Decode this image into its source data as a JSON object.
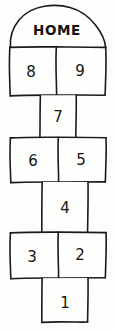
{
  "drawing": {
    "title": "hopscotch-court",
    "style": "hand-drawn ink sketch",
    "medium": "black pen on white paper",
    "canvas": {
      "width": 116,
      "height": 330,
      "background_color": "#fdfdfb"
    },
    "ink_color": "#1a1a18",
    "cell_fill_color": "#fefefc"
  },
  "labels": {
    "home": "HOME"
  },
  "cells": [
    {
      "id": "home-arch",
      "label": "HOME",
      "shape": "dome",
      "x": 10,
      "y": 5,
      "width": 96,
      "height": 42,
      "label_x": 57,
      "label_y": 31
    },
    {
      "id": "cell-8",
      "label": "8",
      "shape": "rect",
      "x": 9,
      "y": 47,
      "width": 47,
      "height": 48,
      "label_x": 31,
      "label_y": 72
    },
    {
      "id": "cell-9",
      "label": "9",
      "shape": "rect",
      "x": 56,
      "y": 47,
      "width": 50,
      "height": 48,
      "label_x": 80,
      "label_y": 71
    },
    {
      "id": "cell-7",
      "label": "7",
      "shape": "rect",
      "x": 40,
      "y": 95,
      "width": 36,
      "height": 42,
      "label_x": 58,
      "label_y": 117
    },
    {
      "id": "cell-6",
      "label": "6",
      "shape": "rect",
      "x": 10,
      "y": 137,
      "width": 48,
      "height": 45,
      "label_x": 33,
      "label_y": 161
    },
    {
      "id": "cell-5",
      "label": "5",
      "shape": "rect",
      "x": 58,
      "y": 137,
      "width": 48,
      "height": 45,
      "label_x": 81,
      "label_y": 160
    },
    {
      "id": "cell-4",
      "label": "4",
      "shape": "rect",
      "x": 42,
      "y": 182,
      "width": 46,
      "height": 50,
      "label_x": 65,
      "label_y": 208
    },
    {
      "id": "cell-3",
      "label": "3",
      "shape": "rect",
      "x": 10,
      "y": 232,
      "width": 48,
      "height": 46,
      "label_x": 32,
      "label_y": 257
    },
    {
      "id": "cell-2",
      "label": "2",
      "shape": "rect",
      "x": 58,
      "y": 232,
      "width": 48,
      "height": 46,
      "label_x": 80,
      "label_y": 255
    },
    {
      "id": "cell-1",
      "label": "1",
      "shape": "rect",
      "x": 42,
      "y": 278,
      "width": 46,
      "height": 44,
      "label_x": 65,
      "label_y": 303
    }
  ],
  "sequence": [
    "1",
    "2",
    "3",
    "4",
    "5",
    "6",
    "7",
    "8",
    "9",
    "HOME"
  ]
}
